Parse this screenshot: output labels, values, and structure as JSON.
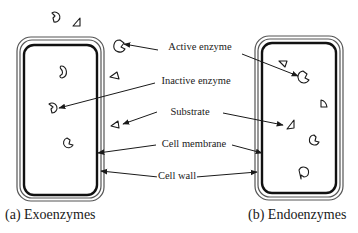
{
  "diagram": {
    "labels": {
      "active_enzyme": "Active enzyme",
      "inactive_enzyme": "Inactive enzyme",
      "substrate": "Substrate",
      "cell_membrane": "Cell membrane",
      "cell_wall": "Cell wall"
    },
    "captions": {
      "left": "(a) Exoenzymes",
      "right": "(b) Endoenzymes"
    },
    "panels": [
      {
        "name": "Exoenzymes",
        "enzymes_outside_cell": [
          "inactive enzyme",
          "substrate",
          "active enzyme",
          "substrate",
          "substrate"
        ],
        "enzymes_inside_cell": [
          "inactive enzyme",
          "inactive enzyme",
          "active enzyme"
        ]
      },
      {
        "name": "Endoenzymes",
        "enzymes_inside_cell": [
          "substrate",
          "active enzyme",
          "substrate",
          "substrate",
          "active enzyme",
          "inactive enzyme"
        ]
      }
    ],
    "colors": {
      "stroke": "#1a1a1a",
      "wall": "#555555",
      "background": "#ffffff"
    }
  }
}
